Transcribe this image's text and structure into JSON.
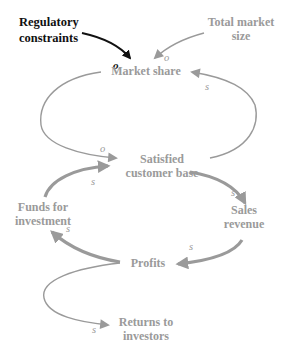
{
  "diagram": {
    "type": "causal-loop",
    "colors": {
      "background": "#ffffff",
      "external_dark": "#111111",
      "main": "#9a9a9a"
    },
    "nodes": {
      "regulatory": {
        "line1": "Regulatory",
        "line2": "constraints"
      },
      "total_market": {
        "line1": "Total market",
        "line2": "size"
      },
      "market_share": {
        "line1": "Market share"
      },
      "satisfied": {
        "line1": "Satisfied",
        "line2": "customer base"
      },
      "sales": {
        "line1": "Sales",
        "line2": "revenue"
      },
      "funds": {
        "line1": "Funds for",
        "line2": "investment"
      },
      "profits": {
        "line1": "Profits"
      },
      "returns": {
        "line1": "Returns to",
        "line2": "investors"
      }
    },
    "edges": [
      {
        "from": "Regulatory constraints",
        "to": "Market share",
        "polarity": "o"
      },
      {
        "from": "Total market size",
        "to": "Market share",
        "polarity": "o"
      },
      {
        "from": "Market share",
        "to": "Satisfied customer base",
        "polarity": "o"
      },
      {
        "from": "Satisfied customer base",
        "to": "Market share",
        "polarity": "s"
      },
      {
        "from": "Satisfied customer base",
        "to": "Sales revenue",
        "polarity": "s"
      },
      {
        "from": "Sales revenue",
        "to": "Profits",
        "polarity": "s"
      },
      {
        "from": "Profits",
        "to": "Funds for investment",
        "polarity": "s"
      },
      {
        "from": "Funds for investment",
        "to": "Satisfied customer base",
        "polarity": "s"
      },
      {
        "from": "Profits",
        "to": "Returns to investors",
        "polarity": "s"
      }
    ],
    "polarity_labels": {
      "reg_ms": "o",
      "tms_ms": "o",
      "ms_scb": "o",
      "scb_ms": "s",
      "scb_sr": "s",
      "sr_pr": "s",
      "pr_ffi": "s",
      "ffi_scb": "s",
      "pr_rti": "s"
    }
  }
}
